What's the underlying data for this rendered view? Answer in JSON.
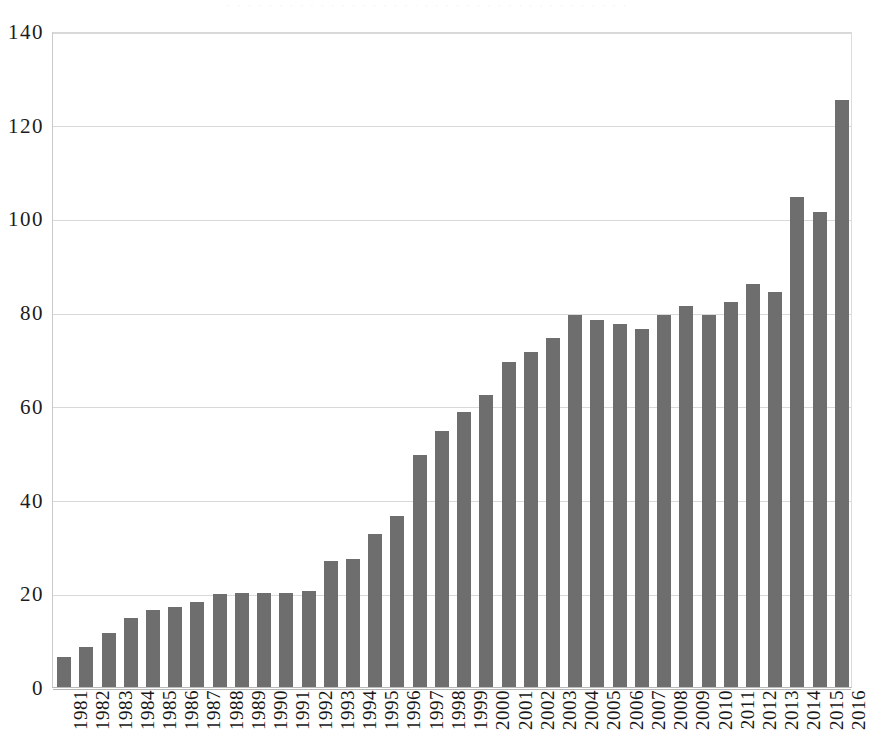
{
  "top_strip_text": "· · · · · · · · · · · · · · · · · · · · · · · · · · · · · · · · · · · · · · ·",
  "chart_data": {
    "type": "bar",
    "title": "",
    "subtitle": "",
    "xlabel": "",
    "ylabel": "",
    "ylim": [
      0,
      140
    ],
    "ytick_step": 20,
    "ytick_labels": [
      "0",
      "20",
      "40",
      "60",
      "80",
      "100",
      "120",
      "140"
    ],
    "ytick_values": [
      0,
      20,
      40,
      60,
      80,
      100,
      120,
      140
    ],
    "grid": true,
    "legend": null,
    "legend_position": "none",
    "bar_color": "#6e6e6e",
    "gridline_color": "#d9d9d9",
    "axis_color": "#b5b5b5",
    "xtick_rotation": -90,
    "categories": [
      "1981",
      "1982",
      "1983",
      "1984",
      "1985",
      "1986",
      "1987",
      "1988",
      "1989",
      "1990",
      "1991",
      "1992",
      "1993",
      "1994",
      "1995",
      "1996",
      "1997",
      "1998",
      "1999",
      "2000",
      "2001",
      "2002",
      "2003",
      "2004",
      "2005",
      "2006",
      "2007",
      "2008",
      "2009",
      "2010",
      "2011",
      "2012",
      "2013",
      "2014",
      "2015",
      "2016"
    ],
    "values": [
      6.3,
      8.5,
      11.5,
      14.8,
      16.4,
      17.1,
      18.2,
      19.8,
      20.0,
      20.0,
      20.0,
      20.5,
      27.0,
      27.3,
      32.7,
      36.5,
      49.5,
      54.6,
      58.6,
      62.4,
      69.4,
      71.4,
      74.4,
      79.5,
      78.4,
      77.4,
      76.5,
      79.5,
      81.4,
      79.5,
      82.2,
      86.1,
      84.3,
      104.5,
      101.3,
      125.2
    ],
    "series": [
      {
        "name": "",
        "values": [
          6.3,
          8.5,
          11.5,
          14.8,
          16.4,
          17.1,
          18.2,
          19.8,
          20.0,
          20.0,
          20.0,
          20.5,
          27.0,
          27.3,
          32.7,
          36.5,
          49.5,
          54.6,
          58.6,
          62.4,
          69.4,
          71.4,
          74.4,
          79.5,
          78.4,
          77.4,
          76.5,
          79.5,
          81.4,
          79.5,
          82.2,
          86.1,
          84.3,
          104.5,
          101.3,
          125.2
        ]
      }
    ]
  }
}
